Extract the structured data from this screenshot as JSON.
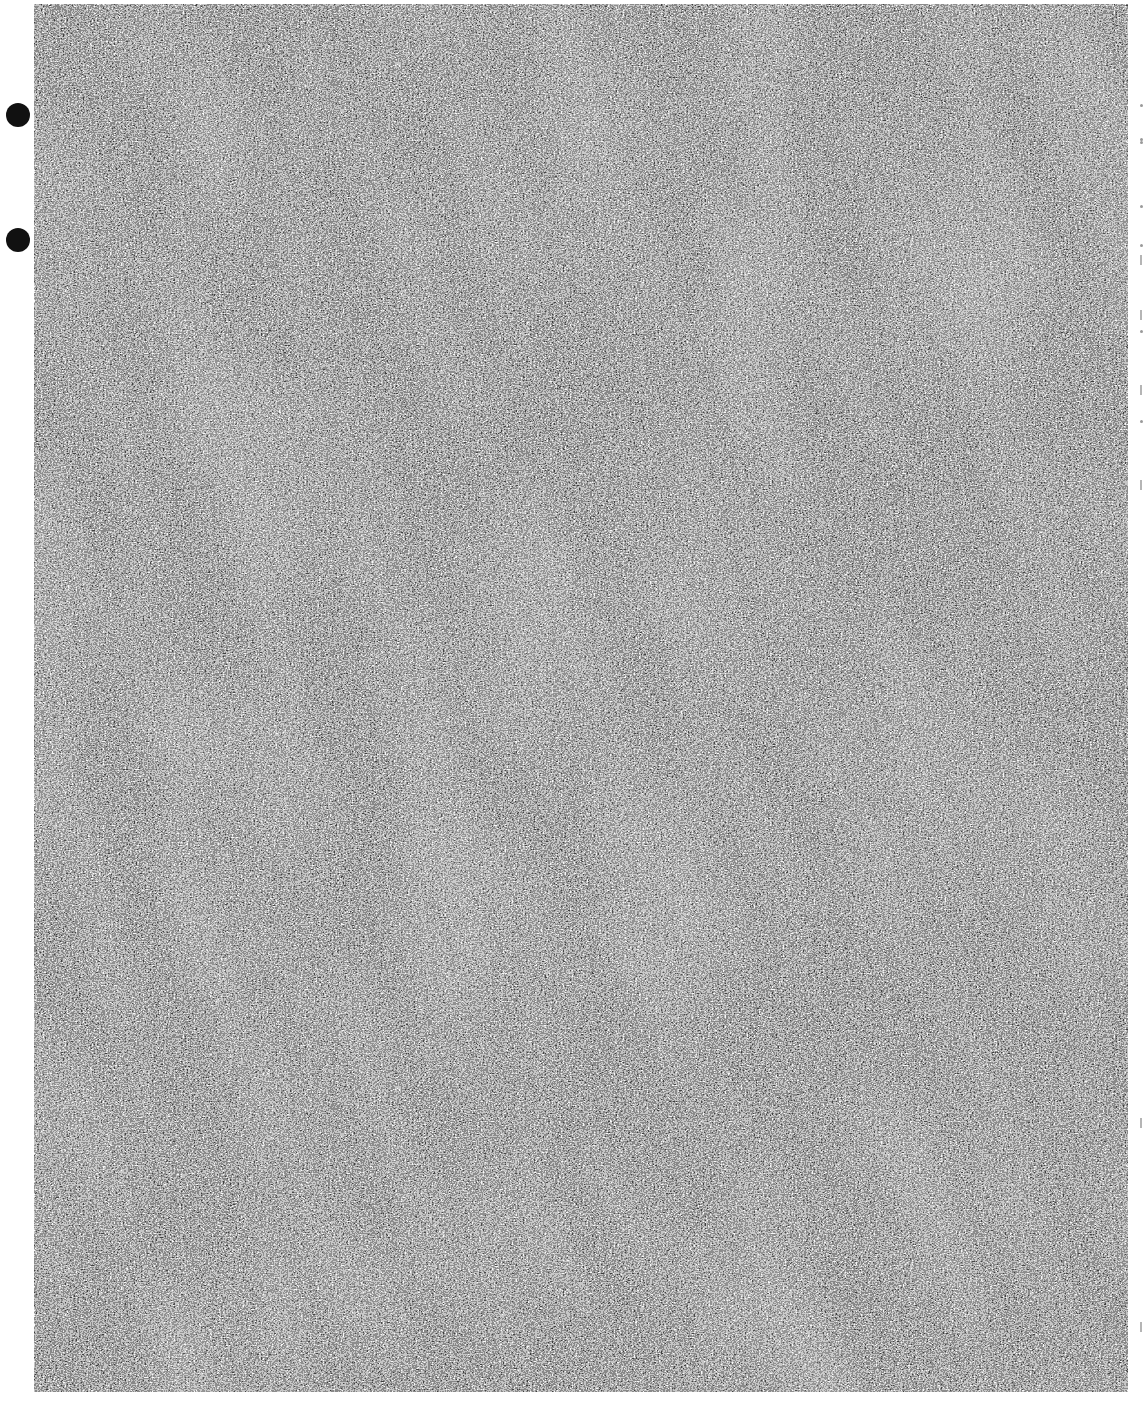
{
  "page": {
    "kind": "scanned-noise-page",
    "background_color": "#ffffff",
    "noise_color_dark": "#111111",
    "noise_color_light": "#f4f4f4"
  },
  "punch_holes": [
    {
      "x": 6,
      "y": 103
    },
    {
      "x": 6,
      "y": 228
    }
  ],
  "right_margin_marks": [
    {
      "type": "speck",
      "y": 104
    },
    {
      "type": "speck",
      "y": 138
    },
    {
      "type": "speck",
      "y": 141
    },
    {
      "type": "speck",
      "y": 205
    },
    {
      "type": "speck",
      "y": 244
    },
    {
      "type": "dash",
      "y": 255
    },
    {
      "type": "dash",
      "y": 310
    },
    {
      "type": "speck",
      "y": 330
    },
    {
      "type": "dash",
      "y": 385
    },
    {
      "type": "speck",
      "y": 420
    },
    {
      "type": "dash",
      "y": 480
    },
    {
      "type": "dash",
      "y": 1118
    },
    {
      "type": "dash",
      "y": 1322
    }
  ]
}
